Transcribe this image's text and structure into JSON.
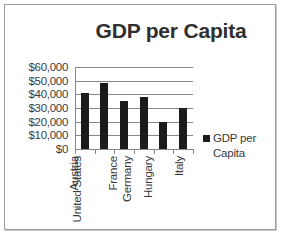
{
  "chart_data": {
    "type": "bar",
    "title": "GDP per Capita",
    "xlabel": "",
    "ylabel": "",
    "categories": [
      "Austria",
      "United States",
      "France",
      "Germany",
      "Hungary",
      "Italy"
    ],
    "values": [
      41000,
      48000,
      35000,
      38000,
      20000,
      30000
    ],
    "series": [
      {
        "name": "GDP per Capita",
        "values": [
          41000,
          48000,
          35000,
          38000,
          20000,
          30000
        ]
      }
    ],
    "ylim": [
      0,
      60000
    ],
    "ytick_step": 10000,
    "ytick_labels": [
      "$60,000",
      "$50,000",
      "$40,000",
      "$30,000",
      "$20,000",
      "$10,000",
      "$0"
    ],
    "ytick_values": [
      60000,
      50000,
      40000,
      30000,
      20000,
      10000,
      0
    ],
    "grid": true,
    "legend_position": "right",
    "legend_entries": [
      "GDP per Capita"
    ],
    "bar_color": "#1b1b1b",
    "gridline_color": "#878787",
    "axis_color": "#878787",
    "text_color": "#3a3a3a",
    "title_color": "#2f2f2f",
    "plot_background": "#ffffff"
  },
  "legend": {
    "series_label_line1": "GDP per",
    "series_label_line2": "Capita"
  },
  "frame": {
    "border_color": "#9a9a9a"
  }
}
